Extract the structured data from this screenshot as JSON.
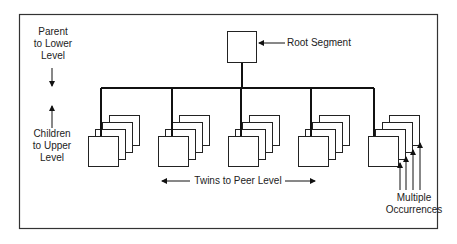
{
  "diagram": {
    "title": "",
    "root": {
      "label": "Root Segment"
    },
    "left_labels": {
      "parent": [
        "Parent",
        "to Lower",
        "Level"
      ],
      "children": [
        "Children",
        "to Upper",
        "Level"
      ]
    },
    "bottom_label": "Twins to Peer Level",
    "multiple_label": [
      "Multiple",
      "Occurrences"
    ],
    "child_stacks": [
      {
        "id": "child-1",
        "occurrences": 4
      },
      {
        "id": "child-2",
        "occurrences": 4
      },
      {
        "id": "child-3",
        "occurrences": 4
      },
      {
        "id": "child-4",
        "occurrences": 4
      },
      {
        "id": "child-5",
        "occurrences": 4
      }
    ],
    "colors": {
      "line": "#111111",
      "frame": "#333333",
      "background": "#ffffff"
    }
  }
}
